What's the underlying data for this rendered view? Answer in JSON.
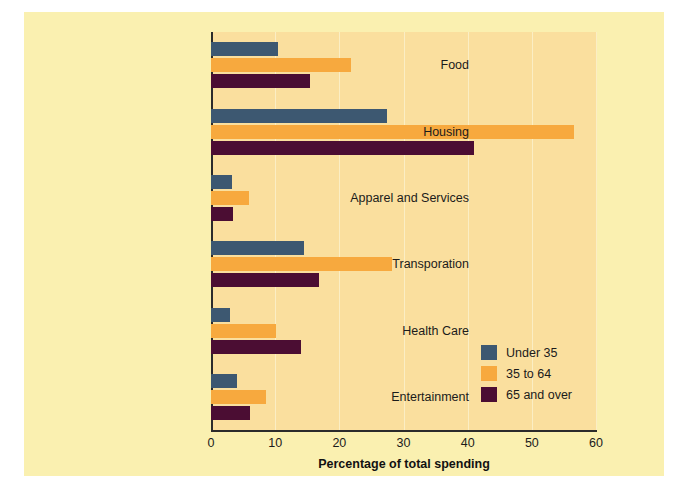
{
  "chart_data": {
    "type": "bar",
    "orientation": "horizontal",
    "title": "",
    "xlabel": "Percentage of total spending",
    "ylabel": "",
    "xlim": [
      0,
      60
    ],
    "xticks": [
      0,
      10,
      20,
      30,
      40,
      50,
      60
    ],
    "grid": true,
    "grid_axis": "x",
    "legend_position": "inside-lower-right",
    "categories": [
      "Food",
      "Housing",
      "Apparel and Services",
      "Transporation",
      "Health Care",
      "Entertainment"
    ],
    "series": [
      {
        "name": "Under 35",
        "color": "#3d5871",
        "values": [
          10.5,
          27.5,
          3.3,
          14.5,
          3.0,
          4.0
        ]
      },
      {
        "name": "35 to 64",
        "color": "#f7a93e",
        "values": [
          21.8,
          56.5,
          5.9,
          28.2,
          10.2,
          8.5
        ]
      },
      {
        "name": "65 and over",
        "color": "#4b0d33",
        "values": [
          15.5,
          41.0,
          3.4,
          16.8,
          14.0,
          6.1
        ]
      }
    ]
  },
  "figure": {
    "background_color": "#faf0b0",
    "plot_background_color": "#fadf9e",
    "gridline_color": "#fbeec4",
    "axis_color": "#2b2b2b"
  }
}
